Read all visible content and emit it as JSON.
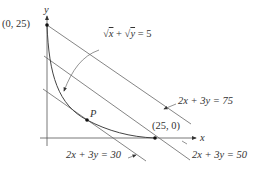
{
  "diagram": {
    "axes": {
      "x_label": "x",
      "y_label": "y"
    },
    "curve": {
      "equation": "√x + √y = 5",
      "sqrt_x": "x",
      "sqrt_y": "y",
      "rhs": "= 5",
      "plus": "+"
    },
    "points": [
      {
        "name": "y-intercept",
        "label": "(0, 25)"
      },
      {
        "name": "x-intercept",
        "label": "(25, 0)"
      },
      {
        "name": "tangent-point",
        "label": "P"
      }
    ],
    "lines": [
      {
        "label": "2x + 3y = 75"
      },
      {
        "label": "2x + 3y = 50"
      },
      {
        "label": "2x + 3y = 30"
      }
    ],
    "colors": {
      "line": "#555555",
      "text": "#333333"
    }
  }
}
